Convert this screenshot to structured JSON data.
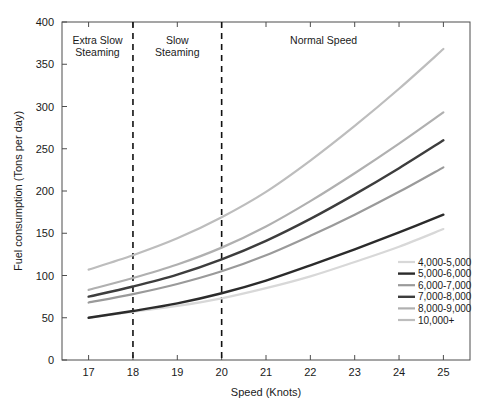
{
  "chart_data": {
    "type": "line",
    "title": "",
    "xlabel": "Speed (Knots)",
    "ylabel": "Fuel consumption (Tons per day)",
    "xlim": [
      16.4,
      25.6
    ],
    "ylim": [
      0,
      400
    ],
    "xticks": [
      "17",
      "18",
      "19",
      "20",
      "21",
      "22",
      "23",
      "24",
      "25"
    ],
    "yticks": [
      "0",
      "50",
      "100",
      "150",
      "200",
      "250",
      "300",
      "350",
      "400"
    ],
    "grid": false,
    "legend_position": "lower right",
    "x": [
      17,
      18,
      19,
      20,
      21,
      22,
      23,
      24,
      25
    ],
    "series": [
      {
        "name": "4,000-5,000",
        "color": "#d8d8d8",
        "width": 2.2,
        "values": [
          50,
          57,
          64,
          73,
          85,
          99,
          116,
          134,
          155
        ]
      },
      {
        "name": "5,000-6,000",
        "color": "#2b2b2b",
        "width": 2.4,
        "values": [
          50,
          58,
          67,
          79,
          94,
          112,
          131,
          151,
          172
        ]
      },
      {
        "name": "6,000-7,000",
        "color": "#9a9a9a",
        "width": 2.2,
        "values": [
          68,
          78,
          90,
          105,
          124,
          147,
          172,
          199,
          228
        ]
      },
      {
        "name": "7,000-8,000",
        "color": "#3d3d3d",
        "width": 2.4,
        "values": [
          75,
          87,
          101,
          119,
          141,
          167,
          196,
          227,
          260
        ]
      },
      {
        "name": "8,000-9,000",
        "color": "#b0b0b0",
        "width": 2.2,
        "values": [
          83,
          97,
          113,
          133,
          158,
          188,
          221,
          256,
          293
        ]
      },
      {
        "name": "10,000+",
        "color": "#bdbdbd",
        "width": 2.2,
        "values": [
          107,
          124,
          144,
          169,
          199,
          236,
          277,
          321,
          368
        ]
      }
    ],
    "zones": [
      {
        "name": "extra-slow-steaming",
        "label_line1": "Extra Slow",
        "label_line2": "Steaming",
        "center": 17.2
      },
      {
        "name": "slow-steaming",
        "label_line1": "Slow",
        "label_line2": "Steaming",
        "center": 19.0
      },
      {
        "name": "normal-speed",
        "label_line1": "Normal Speed",
        "label_line2": "",
        "center": 22.3
      }
    ],
    "zone_dividers": [
      18,
      20
    ],
    "annotations": []
  }
}
